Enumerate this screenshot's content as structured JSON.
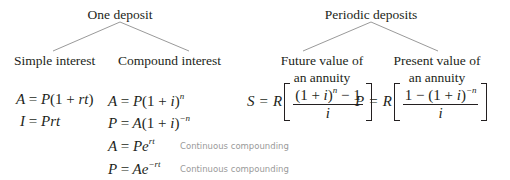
{
  "colors": {
    "text": "#231f20",
    "connector": "#9a9a9a",
    "note": "#9a9a9a",
    "background": "#ffffff"
  },
  "tree": {
    "one_deposit": {
      "label": "One deposit",
      "children": [
        {
          "label": "Simple interest",
          "formulas": [
            {
              "lhs": "A",
              "rhs_parts": [
                "P(1 + ",
                "rt",
                ")"
              ],
              "text": "A = P(1 + rt)"
            },
            {
              "lhs": "I",
              "text": "I = Prt"
            }
          ]
        },
        {
          "label": "Compound interest",
          "formulas": [
            {
              "text": "A = P(1 + i)^n",
              "base": "P(1 + i)",
              "exp": "n"
            },
            {
              "text": "P = A(1 + i)^-n",
              "base": "A(1 + i)",
              "exp": "−n"
            },
            {
              "text": "A = Pe^rt",
              "base": "Pe",
              "exp": "rt",
              "note": "Continuous compounding"
            },
            {
              "text": "P = Ae^-rt",
              "base": "Ae",
              "exp": "−rt",
              "note": "Continuous compounding"
            }
          ]
        }
      ]
    },
    "periodic_deposits": {
      "label": "Periodic deposits",
      "children": [
        {
          "label_line1": "Future value of",
          "label_line2": "an annuity",
          "formula": {
            "text": "S = R[((1 + i)^n − 1) / i]",
            "lhs": "S",
            "coef": "R",
            "numerator_base": "(1 + i)",
            "numerator_exp": "n",
            "numerator_tail": " − 1",
            "denominator": "i"
          }
        },
        {
          "label_line1": "Present value of",
          "label_line2": "an annuity",
          "formula": {
            "text": "P = R[(1 − (1 + i)^-n) / i]",
            "lhs": "P",
            "coef": "R",
            "numerator_head": "1 − (1 + i)",
            "numerator_exp": "−n",
            "denominator": "i"
          }
        }
      ]
    }
  }
}
